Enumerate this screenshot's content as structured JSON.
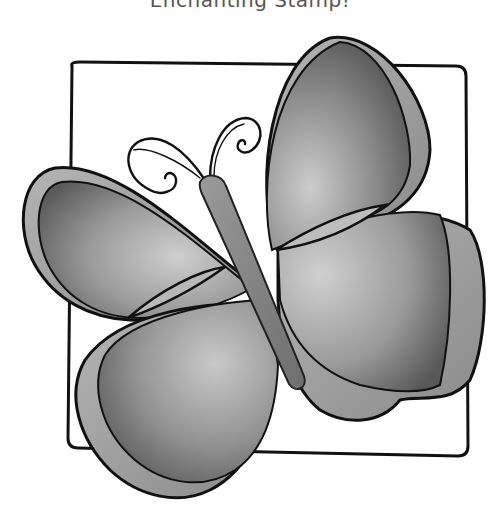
{
  "caption": {
    "text": "Enchanting Stamp!"
  },
  "illustration": {
    "subject": "butterfly",
    "style": "grayscale rubber stamp line art with shaded wings",
    "frame": "hand-drawn rounded square behind butterfly",
    "colors": {
      "outline": "#111111",
      "wing_dark": "#5e5e5e",
      "wing_mid": "#8a8a8a",
      "wing_light": "#c4c4c4",
      "body": "#7c7c7c",
      "background": "#ffffff"
    }
  }
}
